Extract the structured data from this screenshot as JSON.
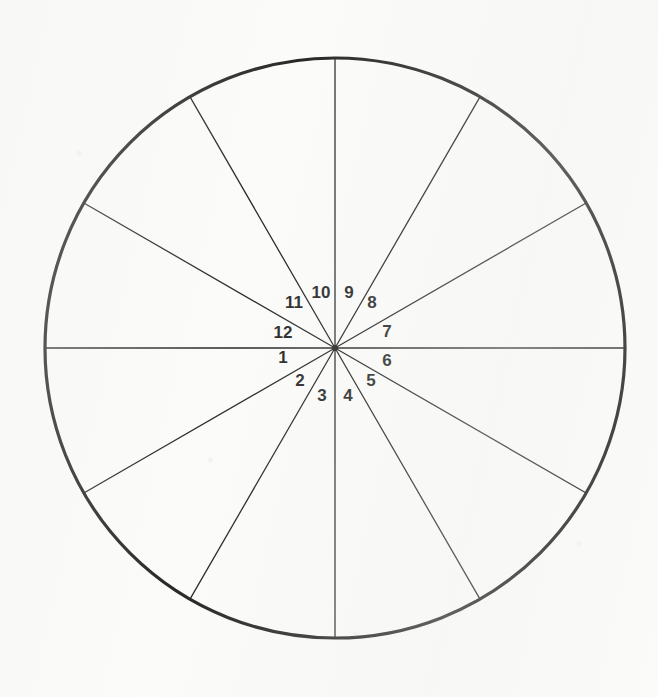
{
  "figure": {
    "background_color": "#fbfbfa",
    "ink_color": "#111111",
    "circle": {
      "center_x": 335,
      "center_y": 348,
      "radius": 290,
      "stroke_width": 3.2
    },
    "spokes": {
      "count": 12,
      "stroke_width": 1.3,
      "angle_step_degrees": 30,
      "start_angle_degrees": 0,
      "note": "Twelve radii drawn from the centre to the circumference, spaced 30 degrees apart"
    },
    "labels": [
      {
        "text": "1",
        "x": 283,
        "y": 359
      },
      {
        "text": "2",
        "x": 300,
        "y": 382
      },
      {
        "text": "3",
        "x": 322,
        "y": 397
      },
      {
        "text": "4",
        "x": 348,
        "y": 397
      },
      {
        "text": "5",
        "x": 371,
        "y": 382
      },
      {
        "text": "6",
        "x": 387,
        "y": 362
      },
      {
        "text": "7",
        "x": 387,
        "y": 333
      },
      {
        "text": "8",
        "x": 372,
        "y": 304
      },
      {
        "text": "9",
        "x": 349,
        "y": 294
      },
      {
        "text": "10",
        "x": 321,
        "y": 294
      },
      {
        "text": "11",
        "x": 294,
        "y": 304
      },
      {
        "text": "12",
        "x": 283,
        "y": 334
      }
    ]
  },
  "chart_data": {
    "type": "pie",
    "categories": [
      "1",
      "2",
      "3",
      "4",
      "5",
      "6",
      "7",
      "8",
      "9",
      "10",
      "11",
      "12"
    ],
    "values": [
      1,
      1,
      1,
      1,
      1,
      1,
      1,
      1,
      1,
      1,
      1,
      1
    ],
    "slice_angle_degrees": 30,
    "total_degrees": 360,
    "legend": "none",
    "grid": false,
    "xlabel": "",
    "ylabel": ""
  }
}
